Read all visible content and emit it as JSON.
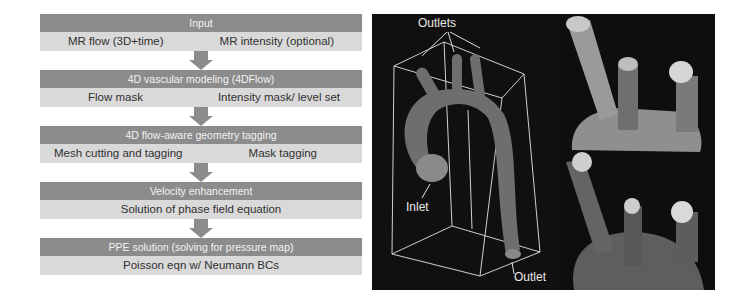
{
  "flowchart": {
    "stages": [
      {
        "title": "Input",
        "items": [
          "MR flow (3D+time)",
          "MR intensity (optional)"
        ]
      },
      {
        "title": "4D vascular modeling (4DFlow)",
        "items": [
          "Flow mask",
          "Intensity mask/ level set"
        ]
      },
      {
        "title": "4D flow-aware geometry  tagging",
        "items": [
          "Mesh cutting and tagging",
          "Mask tagging"
        ]
      },
      {
        "title": "Velocity  enhancement",
        "items": [
          "Solution of phase field equation"
        ]
      },
      {
        "title": "PPE solution  (solving for pressure map)",
        "items": [
          "Poisson eqn w/ Neumann BCs"
        ]
      }
    ]
  },
  "render_main": {
    "labels": {
      "outlets": "Outlets",
      "inlet": "Inlet",
      "outlet": "Outlet"
    }
  },
  "colors": {
    "header_bg": "#8c8c8c",
    "body_bg": "#d9d9d9",
    "render_bg": "#101010",
    "vessel": "#6e6e6e"
  }
}
